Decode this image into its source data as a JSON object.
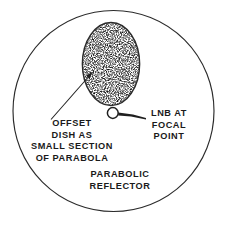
{
  "diagram": {
    "title": "Offset dish as small section of parabola",
    "type": "line-drawing",
    "colors": {
      "stroke": "#2b2b2b",
      "background": "#ffffff",
      "stipple": "#3a3a3a",
      "text": "#1a1a1a"
    },
    "shapes": {
      "parabolic_reflector_circle": {
        "name": "parabolic-reflector-circle",
        "cx": 113.5,
        "cy": 111,
        "r": 101
      },
      "offset_dish_ellipse": {
        "name": "offset-dish-ellipse",
        "cx": 111,
        "cy": 64,
        "rx": 29,
        "ry": 42,
        "fill": "stippled"
      },
      "lnb_circle": {
        "name": "lnb-focal-point-circle",
        "cx": 113,
        "cy": 113,
        "r": 5.5
      }
    },
    "labels": {
      "offset_dish": {
        "name": "offset-dish-label",
        "lines": [
          "OFFSET",
          "DISH AS",
          "SMALL SECTION",
          "OF PARABOLA"
        ]
      },
      "lnb": {
        "name": "lnb-label",
        "lines": [
          "LNB AT",
          "FOCAL",
          "POINT"
        ]
      },
      "parabolic_reflector": {
        "name": "parabolic-reflector-label",
        "lines": [
          "PARABOLIC",
          "REFLECTOR"
        ]
      }
    },
    "annotations": {
      "offset_dish_arrow": {
        "name": "offset-dish-arrow",
        "from": [
          51,
          119
        ],
        "to": [
          92,
          73
        ],
        "points_to": "offset-dish-ellipse"
      },
      "lnb_arrow": {
        "name": "lnb-arrow",
        "from": [
          146,
          117
        ],
        "to": [
          119,
          113
        ],
        "points_to": "lnb-focal-point-circle"
      }
    }
  }
}
